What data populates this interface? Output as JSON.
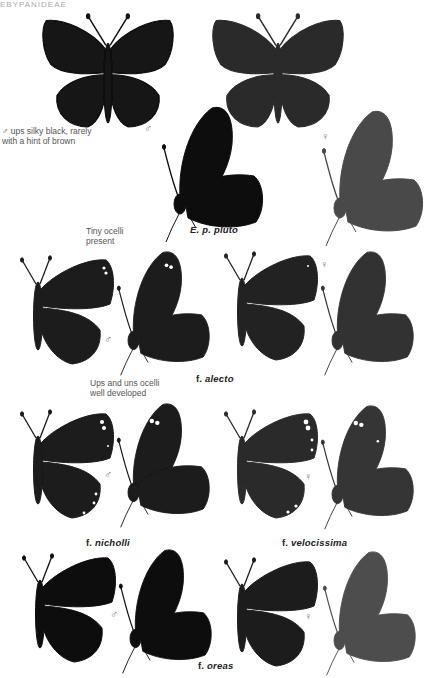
{
  "page_header": "EBYPANIDEAE",
  "top_section": {
    "note": [
      "♂ ups silky black, rarely",
      "with a hint of brown"
    ],
    "male_symbol": "♂",
    "female_symbol": "♀",
    "caption_prefix": "",
    "caption_name": "E. p. pluto"
  },
  "alecto_section": {
    "note": [
      "Tiny ocelli",
      "present"
    ],
    "male_symbol": "♂",
    "female_symbol": "♀",
    "caption_prefix": "f.",
    "caption_name": "alecto"
  },
  "nicholli_section": {
    "note": [
      "Ups and uns ocelli",
      "well developed"
    ],
    "male_symbol": "♂",
    "female_symbol": "♀",
    "caption_left_prefix": "f.",
    "caption_left_name": "nicholli",
    "caption_right_prefix": "f.",
    "caption_right_name": "velocissima"
  },
  "oreas_section": {
    "male_symbol": "♂",
    "female_symbol": "♀",
    "caption_prefix": "f.",
    "caption_name": "oreas"
  },
  "colors": {
    "male_wing": "#141414",
    "female_wing": "#2e2e2e",
    "female_underside": "#4a4a4a",
    "ocellus": "#ffffff"
  }
}
